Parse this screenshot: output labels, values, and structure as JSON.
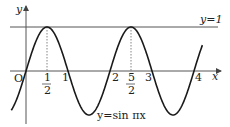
{
  "chart_data": {
    "type": "line",
    "title": "",
    "function": "y = sin πx",
    "curve_label": "y=sin πx",
    "reference_line_label": "y=1",
    "xlabel": "x",
    "ylabel": "y",
    "origin_label": "O",
    "x_ticks": [
      {
        "value": 0.5,
        "num": "1",
        "den": "2"
      },
      {
        "value": 1,
        "label": "1"
      },
      {
        "value": 2,
        "label": "2"
      },
      {
        "value": 2.5,
        "num": "5",
        "den": "2"
      },
      {
        "value": 3,
        "label": "3"
      },
      {
        "value": 4,
        "label": "4"
      }
    ],
    "xlim": [
      -0.6,
      4.6
    ],
    "ylim": [
      -1.2,
      1.4
    ],
    "grid": false,
    "dashed_guides_at_x": [
      0.5,
      2.5
    ],
    "colors": {
      "curve": "#1a1a1a",
      "axis": "#555555",
      "guide": "#666666"
    }
  }
}
